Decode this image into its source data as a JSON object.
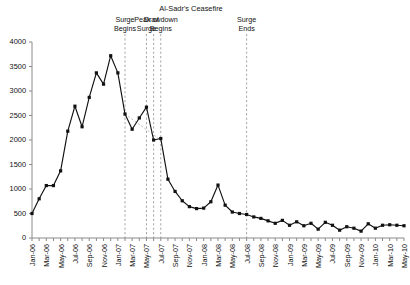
{
  "chart_data": {
    "type": "line",
    "title": "",
    "subtitle": "",
    "xlabel": "",
    "ylabel": "",
    "ylim": [
      0,
      4000
    ],
    "ytick_values": [
      0,
      500,
      1000,
      1500,
      2000,
      2500,
      3000,
      3500,
      4000
    ],
    "ytick_labels": [
      "0",
      "500",
      "1000",
      "1500",
      "2000",
      "2500",
      "3000",
      "3500",
      "4000"
    ],
    "grid": false,
    "legend_position": "none",
    "marker": "square",
    "line_color": "#111111",
    "x": [
      "Jan-06",
      "Feb-06",
      "Mar-06",
      "Apr-06",
      "May-06",
      "Jun-06",
      "Jul-06",
      "Aug-06",
      "Sep-06",
      "Oct-06",
      "Nov-06",
      "Dec-06",
      "Jan-07",
      "Feb-07",
      "Mar-07",
      "Apr-07",
      "May-07",
      "Jun-07",
      "Jul-07",
      "Aug-07",
      "Sep-07",
      "Oct-07",
      "Nov-07",
      "Dec-07",
      "Jan-08",
      "Feb-08",
      "Mar-08",
      "Apr-08",
      "May-08",
      "Jun-08",
      "Jul-08",
      "Aug-08",
      "Sep-08",
      "Oct-08",
      "Nov-08",
      "Dec-08",
      "Jan-09",
      "Feb-09",
      "Mar-09",
      "Apr-09",
      "May-09",
      "Jun-09",
      "Jul-09",
      "Aug-09",
      "Sep-09",
      "Oct-09",
      "Nov-09",
      "Dec-09",
      "Jan-10",
      "Feb-10",
      "Mar-10",
      "Apr-10",
      "May-10"
    ],
    "values": [
      500,
      800,
      1070,
      1070,
      1370,
      2180,
      2690,
      2270,
      2870,
      3370,
      3140,
      3720,
      3370,
      2530,
      2220,
      2450,
      2670,
      2000,
      2030,
      1200,
      950,
      760,
      640,
      600,
      610,
      740,
      1080,
      670,
      530,
      500,
      480,
      430,
      400,
      350,
      300,
      360,
      260,
      330,
      250,
      300,
      180,
      320,
      260,
      160,
      230,
      200,
      140,
      290,
      200,
      260,
      270,
      260,
      250
    ],
    "xtick_labels": [
      "Jan-06",
      "Mar-06",
      "May-06",
      "Jul-06",
      "Sep-06",
      "Nov-06",
      "Jan-07",
      "Mar-07",
      "May-07",
      "Jul-07",
      "Sep-07",
      "Nov-07",
      "Jan-08",
      "Mar-08",
      "May-08",
      "Jul-08",
      "Sep-08",
      "Nov-08",
      "Jan-09",
      "Mar-09",
      "May-09",
      "Jul-09",
      "Sep-09",
      "Nov-09",
      "Jan-10",
      "Mar-10",
      "May-10"
    ],
    "trend_segment": {
      "label": "ceasefire-trend",
      "color": "#b4b4b4",
      "x_start": "Feb-07",
      "x_end": "Jul-07",
      "y_start": 2530,
      "y_end": 2000
    },
    "annotations": [
      {
        "name": "surge-begins",
        "label": "Surge\nBegins",
        "line1": "Surge",
        "line2": "Begins",
        "x": "Feb-07"
      },
      {
        "name": "peak-of-surge",
        "label": "Peak of\nSurge",
        "line1": "Peak of",
        "line2": "Surge",
        "x": "May-07"
      },
      {
        "name": "drawdown-begins",
        "label": "Drawdown\nBegins",
        "line1": "Drawdown",
        "line2": "Begins",
        "x": "Jul-07"
      },
      {
        "name": "surge-ends",
        "label": "Surge\nEnds",
        "line1": "Surge",
        "line2": "Ends",
        "x": "Jul-08"
      }
    ],
    "ceasefire_band": {
      "title": "Al-Sadr's Ceasefire",
      "x_start": "Jun-07",
      "x_end": "Jul-07"
    }
  }
}
